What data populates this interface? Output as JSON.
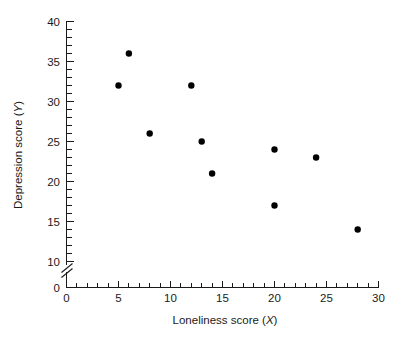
{
  "chart_data": {
    "type": "scatter",
    "title": "",
    "xlabel": "Loneliness score (X)",
    "xlabel_text": "Loneliness score (",
    "xlabel_var": "X",
    "xlabel_close": ")",
    "ylabel": "Depression score (Y)",
    "ylabel_text": "Depression score (",
    "ylabel_var": "Y",
    "ylabel_close": ")",
    "xlim": [
      0,
      30
    ],
    "ylim": [
      0,
      40
    ],
    "y_axis_break": true,
    "y_break_between": [
      0,
      10
    ],
    "grid": false,
    "legend": null,
    "x_major_ticks": [
      0,
      5,
      10,
      15,
      20,
      25,
      30
    ],
    "x_tick_labels": [
      "0",
      "5",
      "10",
      "15",
      "20",
      "25",
      "30"
    ],
    "x_minor_step": 1,
    "y_major_ticks": [
      0,
      10,
      15,
      20,
      25,
      30,
      35,
      40
    ],
    "y_tick_labels": [
      "0",
      "10",
      "15",
      "20",
      "25",
      "30",
      "35",
      "40"
    ],
    "y_minor_step": 1,
    "marker": "filled-circle",
    "marker_color": "#000000",
    "x": [
      5,
      6,
      8,
      12,
      13,
      14,
      20,
      20,
      24,
      28
    ],
    "y": [
      32,
      36,
      26,
      32,
      25,
      21,
      24,
      17,
      23,
      14
    ],
    "points": [
      {
        "x": 5,
        "y": 32
      },
      {
        "x": 6,
        "y": 36
      },
      {
        "x": 8,
        "y": 26
      },
      {
        "x": 12,
        "y": 32
      },
      {
        "x": 13,
        "y": 25
      },
      {
        "x": 14,
        "y": 21
      },
      {
        "x": 20,
        "y": 24
      },
      {
        "x": 20,
        "y": 17
      },
      {
        "x": 24,
        "y": 23
      },
      {
        "x": 28,
        "y": 14
      }
    ]
  },
  "colors": {
    "background": "#ffffff",
    "axis": "#1a1a1a",
    "marker": "#000000"
  }
}
